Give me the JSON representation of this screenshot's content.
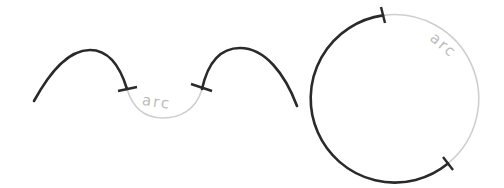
{
  "diagram": {
    "title": "",
    "colors": {
      "main_curve": "#2a2a2a",
      "arc_highlight": "#cfcfcf",
      "label": "#bdbdbd",
      "background": "#ffffff"
    },
    "left_figure": {
      "description": "Two dark humps joined by a light gray U-shaped arc between tick marks",
      "arc_label": "arc"
    },
    "right_figure": {
      "description": "Circle with a dark major arc and a light gray minor arc between two tick marks",
      "arc_label": "arc"
    }
  }
}
